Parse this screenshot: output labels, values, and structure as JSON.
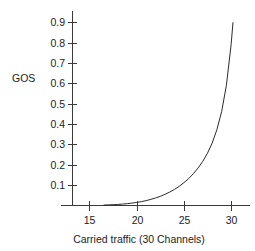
{
  "chart_data": {
    "type": "line",
    "title": "",
    "subtitle": "",
    "xlabel": "Carried traffic (30 Channels)",
    "ylabel": "GOS",
    "xlim": [
      13.2,
      32.0
    ],
    "ylim": [
      0.0,
      0.955
    ],
    "grid": false,
    "legend": null,
    "legend_position": "none",
    "xticks": [
      15,
      20,
      25,
      30
    ],
    "xtick_labels": [
      "15",
      "20",
      "25",
      "30"
    ],
    "yticks": [
      0.1,
      0.2,
      0.3,
      0.4,
      0.5,
      0.6,
      0.7,
      0.8,
      0.9
    ],
    "ytick_labels": [
      "0.1",
      "0.2",
      "0.3",
      "0.4",
      "0.5",
      "0.6",
      "0.7",
      "0.8",
      "0.9"
    ],
    "series": [
      {
        "name": "GOS",
        "color": "#2b2b2b",
        "x": [
          16.5,
          17.0,
          17.5,
          18.0,
          18.5,
          19.0,
          19.5,
          20.0,
          20.5,
          21.0,
          21.5,
          22.0,
          22.5,
          23.0,
          23.5,
          24.0,
          24.5,
          25.0,
          25.5,
          26.0,
          26.5,
          27.0,
          27.5,
          28.0,
          28.5,
          29.0,
          29.5,
          30.0,
          30.2
        ],
        "y": [
          0.002,
          0.003,
          0.004,
          0.005,
          0.007,
          0.009,
          0.012,
          0.015,
          0.019,
          0.024,
          0.03,
          0.037,
          0.045,
          0.055,
          0.066,
          0.079,
          0.094,
          0.112,
          0.132,
          0.156,
          0.184,
          0.217,
          0.257,
          0.307,
          0.373,
          0.462,
          0.59,
          0.79,
          0.9
        ]
      }
    ]
  },
  "axes": {
    "y_label": "GOS",
    "x_label": "Carried traffic (30 Channels)"
  }
}
